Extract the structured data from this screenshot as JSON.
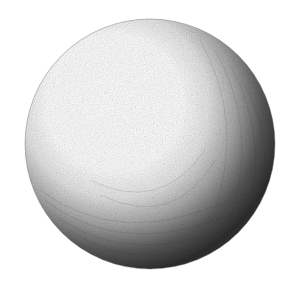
{
  "image": {
    "subject": "pencil sketch of a shaded sphere",
    "background": "#ffffff",
    "sphere": {
      "cx": 150,
      "cy": 144,
      "r": 125,
      "highlight_color": "#ffffff",
      "midtone_color": "#b0b0b0",
      "shadow_color": "#2a2a2a",
      "light_direction": "upper-left"
    }
  }
}
